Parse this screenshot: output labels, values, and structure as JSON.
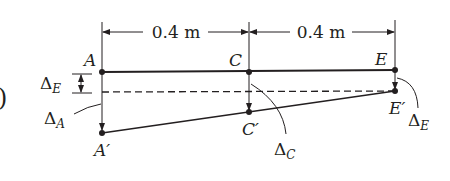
{
  "figure": {
    "part_label_fragment": ")",
    "dimensions": [
      {
        "label": "0.4 m",
        "from": "A",
        "to": "C"
      },
      {
        "label": "0.4 m",
        "from": "C",
        "to": "E"
      }
    ],
    "points": {
      "A": "A",
      "C": "C",
      "E": "E",
      "A_prime": "A′",
      "C_prime": "C′",
      "E_prime": "E′"
    },
    "deflections": {
      "delta_symbol": "Δ",
      "left_marker": {
        "symbol": "Δ",
        "subscript": "E"
      },
      "A": {
        "symbol": "Δ",
        "subscript": "A"
      },
      "C": {
        "symbol": "Δ",
        "subscript": "C"
      },
      "E": {
        "symbol": "Δ",
        "subscript": "E"
      }
    },
    "colors": {
      "ink": "#231f20",
      "background": "#ffffff"
    }
  }
}
